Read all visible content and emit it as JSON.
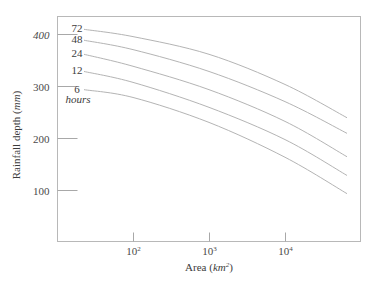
{
  "chart_data": {
    "type": "line",
    "title": "",
    "xlabel": "Area (km²)",
    "xlabel_parts": {
      "prefix": "Area (",
      "unit": "km",
      "sup": "2",
      "suffix": ")"
    },
    "ylabel": "Rainfall depth (mm)",
    "ylabel_parts": {
      "prefix": "Rainfall depth (",
      "unit": "mm",
      "suffix": ")"
    },
    "x_scale": "log",
    "xlim": [
      15,
      80000
    ],
    "ylim": [
      0,
      420
    ],
    "x_ticks": [
      {
        "value": 100,
        "base": "10",
        "exp": "2"
      },
      {
        "value": 1000,
        "base": "10",
        "exp": "3"
      },
      {
        "value": 10000,
        "base": "10",
        "exp": "4"
      }
    ],
    "y_ticks": [
      {
        "value": 100,
        "label": "100"
      },
      {
        "value": 200,
        "label": "200"
      },
      {
        "value": 300,
        "label": "300"
      },
      {
        "value": 400,
        "label": "400"
      }
    ],
    "grid": false,
    "legend": "inline labels at left end of curves",
    "x": [
      25,
      100,
      1000,
      10000,
      60000
    ],
    "series": [
      {
        "name": "72",
        "values": [
          408,
          394,
          360,
          302,
          238
        ]
      },
      {
        "name": "48",
        "values": [
          387,
          369,
          327,
          269,
          208
        ]
      },
      {
        "name": "24",
        "values": [
          360,
          337,
          292,
          231,
          163
        ]
      },
      {
        "name": "12",
        "values": [
          327,
          306,
          258,
          196,
          127
        ]
      },
      {
        "name": "6",
        "values": [
          292,
          277,
          229,
          162,
          92
        ]
      }
    ],
    "series_unit_label": "hours"
  }
}
